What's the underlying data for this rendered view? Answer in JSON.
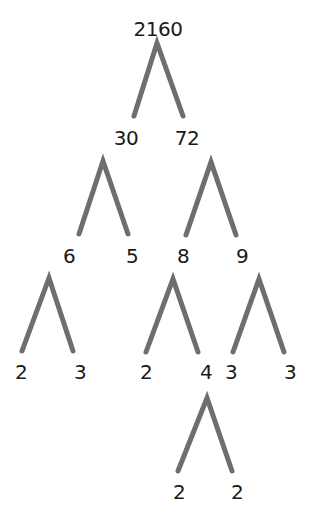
{
  "diagram": {
    "type": "factor-tree",
    "root": "2160",
    "colors": {
      "branch": "#6e6e6e",
      "text": "#1a1a1a",
      "background": "#ffffff"
    },
    "nodes": [
      {
        "id": "n2160",
        "label": "2160",
        "x": 158,
        "y": 19
      },
      {
        "id": "n30",
        "label": "30",
        "x": 126,
        "y": 128
      },
      {
        "id": "n72",
        "label": "72",
        "x": 187,
        "y": 128
      },
      {
        "id": "n6",
        "label": "6",
        "x": 69,
        "y": 246
      },
      {
        "id": "n5",
        "label": "5",
        "x": 132,
        "y": 246
      },
      {
        "id": "n8",
        "label": "8",
        "x": 183,
        "y": 246
      },
      {
        "id": "n9",
        "label": "9",
        "x": 242,
        "y": 246
      },
      {
        "id": "n2a",
        "label": "2",
        "x": 21,
        "y": 362
      },
      {
        "id": "n3a",
        "label": "3",
        "x": 80,
        "y": 362
      },
      {
        "id": "n2b",
        "label": "2",
        "x": 146,
        "y": 362
      },
      {
        "id": "n4",
        "label": "4",
        "x": 206,
        "y": 362
      },
      {
        "id": "n3b",
        "label": "3",
        "x": 231,
        "y": 362
      },
      {
        "id": "n3c",
        "label": "3",
        "x": 290,
        "y": 362
      },
      {
        "id": "n2c",
        "label": "2",
        "x": 179,
        "y": 482
      },
      {
        "id": "n2d",
        "label": "2",
        "x": 237,
        "y": 482
      }
    ],
    "branches": [
      {
        "parent": "2160",
        "children": [
          "30",
          "72"
        ],
        "apex": [
          157,
          43
        ],
        "left": [
          134,
          116
        ],
        "right": [
          183,
          116
        ]
      },
      {
        "parent": "30",
        "children": [
          "6",
          "5"
        ],
        "apex": [
          103,
          161
        ],
        "left": [
          79,
          234
        ],
        "right": [
          128,
          234
        ]
      },
      {
        "parent": "72",
        "children": [
          "8",
          "9"
        ],
        "apex": [
          211,
          162
        ],
        "left": [
          186,
          235
        ],
        "right": [
          236,
          235
        ]
      },
      {
        "parent": "6",
        "children": [
          "2",
          "3"
        ],
        "apex": [
          49,
          278
        ],
        "left": [
          22,
          351
        ],
        "right": [
          73,
          351
        ]
      },
      {
        "parent": "8",
        "children": [
          "2",
          "4"
        ],
        "apex": [
          173,
          279
        ],
        "left": [
          146,
          352
        ],
        "right": [
          198,
          352
        ]
      },
      {
        "parent": "9",
        "children": [
          "3",
          "3"
        ],
        "apex": [
          259,
          279
        ],
        "left": [
          233,
          352
        ],
        "right": [
          284,
          352
        ]
      },
      {
        "parent": "4",
        "children": [
          "2",
          "2"
        ],
        "apex": [
          207,
          398
        ],
        "left": [
          178,
          471
        ],
        "right": [
          232,
          471
        ]
      }
    ]
  }
}
